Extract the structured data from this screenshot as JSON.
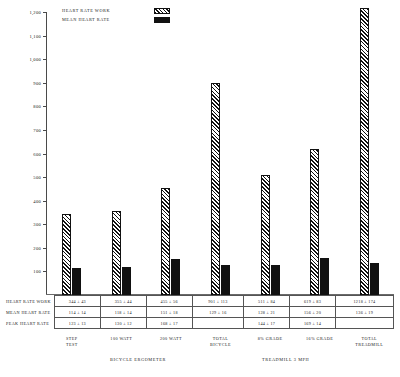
{
  "legend": {
    "items": [
      {
        "label": "HEART RATE WORK",
        "swatch": "hatched-diagonal-swatch"
      },
      {
        "label": "MEAN HEART RATE",
        "swatch": "solid-black-swatch"
      }
    ]
  },
  "table": {
    "row_labels": [
      "HEART RATE WORK",
      "MEAN HEART RATE",
      "PEAK HEART RATE"
    ],
    "rows": [
      [
        "344 ± 43",
        "355 ± 44",
        "455 ± 56",
        "901 ± 113",
        "511 ± 84",
        "619 ± 83",
        "1218 ± 174"
      ],
      [
        "114 ± 14",
        "118 ± 14",
        "151 ± 18",
        "129 ± 16",
        "128 ± 21",
        "156 ± 20",
        "136 ± 19"
      ],
      [
        "123 ± 13",
        "130 ± 12",
        "168 ± 17",
        "",
        "144 ± 17",
        "169 ± 14",
        ""
      ]
    ]
  },
  "xaxis": {
    "labels": [
      [
        "STEP",
        "TEST"
      ],
      [
        "100 WATT",
        ""
      ],
      [
        "200 WATT",
        ""
      ],
      [
        "TOTAL",
        "BICYCLE"
      ],
      [
        "8% GRADE",
        ""
      ],
      [
        "16% GRADE",
        ""
      ],
      [
        "TOTAL",
        "TREADMILL"
      ]
    ],
    "groups": [
      {
        "label": "BICYCLE ERGOMETER"
      },
      {
        "label": "TREADMILL 3 MPH"
      }
    ]
  },
  "chart_data": {
    "type": "bar",
    "title": "",
    "xlabel": "",
    "ylabel": "",
    "ylim": [
      0,
      1200
    ],
    "ytick_labels": [
      "1,200",
      "1,100",
      "1,000",
      "900",
      "800",
      "700",
      "600",
      "500",
      "400",
      "300",
      "200",
      "100"
    ],
    "yticks": [
      1200,
      1100,
      1000,
      900,
      800,
      700,
      600,
      500,
      400,
      300,
      200,
      100
    ],
    "grid": false,
    "legend_position": "top-center",
    "categories": [
      "STEP TEST",
      "100 WATT",
      "200 WATT",
      "TOTAL BICYCLE",
      "8% GRADE",
      "16% GRADE",
      "TOTAL TREADMILL"
    ],
    "series": [
      {
        "name": "HEART RATE WORK",
        "values": [
          344,
          355,
          455,
          901,
          511,
          619,
          1218
        ],
        "errors": [
          43,
          44,
          56,
          113,
          84,
          83,
          174
        ],
        "fill": "hatched-diagonal"
      },
      {
        "name": "MEAN HEART RATE",
        "values": [
          114,
          118,
          151,
          129,
          128,
          156,
          136
        ],
        "errors": [
          14,
          14,
          18,
          16,
          21,
          20,
          19
        ],
        "fill": "solid-black"
      },
      {
        "name": "PEAK HEART RATE",
        "values": [
          123,
          130,
          168,
          null,
          144,
          169,
          null
        ],
        "errors": [
          13,
          12,
          17,
          null,
          17,
          14,
          null
        ],
        "fill": "none-table-only"
      }
    ]
  },
  "colors": {
    "ink": "#111111",
    "axis": "#4a4a4a",
    "background": "#ffffff"
  }
}
